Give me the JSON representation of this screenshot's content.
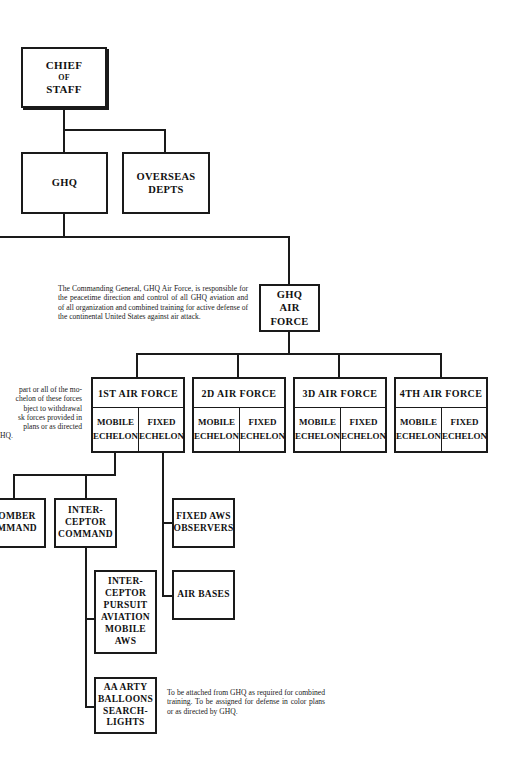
{
  "chart": {
    "chief_of_staff": {
      "line1": "CHIEF",
      "line2": "OF",
      "line3": "STAFF"
    },
    "ghq": {
      "label": "GHQ"
    },
    "overseas_depts": {
      "line1": "OVERSEAS",
      "line2": "DEPTS"
    },
    "ghq_air_force": {
      "line1": "GHQ",
      "line2": "AIR",
      "line3": "FORCE"
    },
    "ghq_air_force_note": "The Commanding General, GHQ Air Force, is responsible for the peacetime direction and control of all GHQ aviation and of all organization and combined training for active defense of the continental United States against air attack.",
    "left_note": {
      "lines": [
        "part or all of the mo-",
        "chelon of these forces",
        "bject to withdrawal",
        "sk forces provided in",
        "plans or as directed",
        "HQ."
      ]
    },
    "air_forces": [
      {
        "name": "1ST AIR FORCE",
        "mobile": [
          "MOBILE",
          "ECHELON"
        ],
        "fixed": [
          "FIXED",
          "ECHELON"
        ]
      },
      {
        "name": "2D AIR FORCE",
        "mobile": [
          "MOBILE",
          "ECHELON"
        ],
        "fixed": [
          "FIXED",
          "ECHELON"
        ]
      },
      {
        "name": "3D AIR FORCE",
        "mobile": [
          "MOBILE",
          "ECHELON"
        ],
        "fixed": [
          "FIXED",
          "ECHELON"
        ]
      },
      {
        "name": "4TH AIR FORCE",
        "mobile": [
          "MOBILE",
          "ECHELON"
        ],
        "fixed": [
          "FIXED",
          "ECHELON"
        ]
      }
    ],
    "bomber_command": {
      "line1": "OMBER",
      "line2": "MMAND"
    },
    "interceptor_command": {
      "line1": "INTER-",
      "line2": "CEPTOR",
      "line3": "COMMAND"
    },
    "fixed_aws": {
      "line1": "FIXED AWS",
      "line2": "OBSERVERS"
    },
    "air_bases": {
      "label": "AIR BASES"
    },
    "interceptor_pursuit": {
      "lines": [
        "INTER-",
        "CEPTOR",
        "PURSUIT",
        "AVIATION",
        "MOBILE",
        "AWS"
      ]
    },
    "aa_arty": {
      "lines": [
        "AA ARTY",
        "BALLOONS",
        "SEARCH-",
        "LIGHTS"
      ]
    },
    "aa_arty_note": "To be attached from GHQ as required for combined training. To be assigned for defense in color plans or as directed by GHQ."
  }
}
